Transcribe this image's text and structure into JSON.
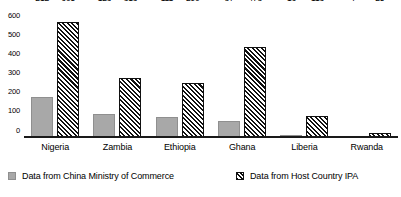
{
  "chart_data": {
    "type": "bar",
    "title": "",
    "subtitle": "",
    "xlabel": "",
    "ylabel": "",
    "ylim": [
      0,
      700
    ],
    "ytick_step": 100,
    "yticks": [
      "0",
      "100",
      "200",
      "300",
      "400",
      "500",
      "600",
      "700"
    ],
    "grid": false,
    "legend_position": "bottom",
    "orientation": "vertical",
    "grouping": "grouped",
    "categories": [
      "Nigeria",
      "Zambia",
      "Ethiopia",
      "Ghana",
      "Liberia",
      "Rwanda"
    ],
    "series": [
      {
        "name": "Data from China Ministry of Commerce",
        "color": "#a8a8a8",
        "pattern": "solid-gray",
        "values": [
          212,
          123,
          111,
          87,
          16,
          7
        ],
        "labels": [
          "212",
          "123",
          "111",
          "87",
          "16",
          "7"
        ]
      },
      {
        "name": "Data from Host Country IPA",
        "color": "#111111",
        "pattern": "diagonal-hatch",
        "values": [
          605,
          313,
          290,
          478,
          113,
          25
        ],
        "labels": [
          "605",
          "313",
          "290",
          "478",
          "113",
          "25"
        ]
      }
    ],
    "annotations": []
  }
}
